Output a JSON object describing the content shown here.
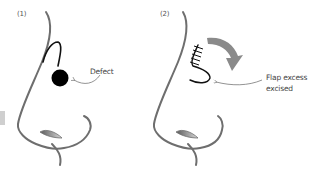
{
  "figure": {
    "panels": [
      {
        "label": "(1)",
        "annotation": "Defect"
      },
      {
        "label": "(2)",
        "annotation_line1": "Flap excess",
        "annotation_line2": "excised"
      }
    ],
    "colors": {
      "nose_outline": "#6e6e6e",
      "flap_line": "#111111",
      "defect_fill": "#000000",
      "arrow_fill": "#8a8a8a",
      "leader_line": "#777777",
      "side_tab": "#cfcfcf"
    }
  }
}
